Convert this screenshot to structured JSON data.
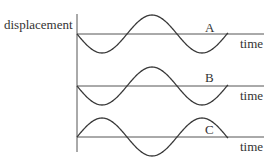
{
  "diagram": {
    "y_axis_label": "displacement",
    "x_axis_label": "time",
    "axis_x": 77,
    "axis_top": 14,
    "axis_bottom": 152,
    "axis_right": 264,
    "wave_start_x": 77,
    "wave_end_x": 228,
    "period_px": 100,
    "amplitude_px": 19,
    "stroke_color": "#3a3a3a",
    "waves": [
      {
        "label": "A",
        "baseline_y": 34,
        "phase": "starts-downward",
        "label_x": 205,
        "label_y": 32,
        "time_label_y": 48
      },
      {
        "label": "B",
        "baseline_y": 86,
        "phase": "starts-downward",
        "label_x": 205,
        "label_y": 82,
        "time_label_y": 100
      },
      {
        "label": "C",
        "baseline_y": 137,
        "phase": "starts-upward",
        "label_x": 205,
        "label_y": 134,
        "time_label_y": 151
      }
    ]
  }
}
